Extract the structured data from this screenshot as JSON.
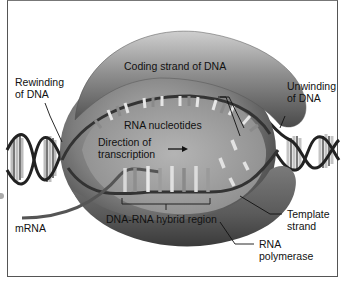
{
  "diagram": {
    "labels": {
      "coding_strand": "Coding strand of DNA",
      "rewinding_line1": "Rewinding",
      "rewinding_line2": "of DNA",
      "unwinding_line1": "Unwinding",
      "unwinding_line2": "of DNA",
      "rna_nucleotides": "RNA nucleotides",
      "direction_line1": "Direction of",
      "direction_line2": "transcription",
      "hybrid_region": "DNA-RNA hybrid region",
      "mrna": "mRNA",
      "template_line1": "Template",
      "template_line2": "strand",
      "polymerase_line1": "RNA",
      "polymerase_line2": "polymerase"
    },
    "colors": {
      "polymerase_body": "#8a8a8a",
      "polymerase_dark": "#4a4a4a",
      "polymerase_light": "#c8c8c8",
      "inner_cavity": "#a9a9a9",
      "dna_strand": "#2a2a2a",
      "base_light": "#e8e8e8",
      "base_mid": "#9a9a9a",
      "frame": "#555555"
    }
  }
}
